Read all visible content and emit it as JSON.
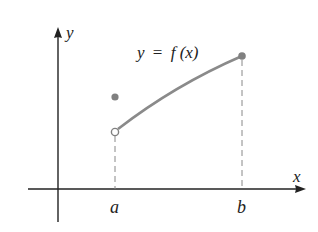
{
  "diagram": {
    "axes": {
      "x_label": "x",
      "y_label": "y"
    },
    "curve_label": {
      "y": "y",
      "eq": "=",
      "f": "f",
      "arg": "(x)",
      "full": "y = f(x)"
    },
    "ticks": {
      "a_label": "a",
      "b_label": "b"
    },
    "points": [
      {
        "name": "f(a) filled",
        "type": "filled",
        "x": 115,
        "y": 97
      },
      {
        "name": "left limit open",
        "type": "open",
        "x": 115,
        "y": 132
      },
      {
        "name": "f(b) filled",
        "type": "filled",
        "x": 242,
        "y": 56
      }
    ],
    "colors": {
      "axis": "#222222",
      "curve": "#8a8a8a",
      "point": "#808080",
      "dash": "#888888"
    }
  }
}
